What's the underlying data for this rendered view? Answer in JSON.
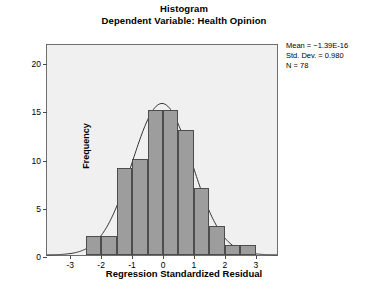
{
  "chart_data": {
    "type": "bar",
    "title": "Histogram",
    "subtitle": "Dependent Variable: Health Opinion",
    "xlabel": "Regression Standardized Residual",
    "ylabel": "Frequency",
    "xlim": [
      -3.75,
      3.75
    ],
    "ylim": [
      0,
      22
    ],
    "grid": false,
    "legend": "none",
    "bin_width": 0.5,
    "bin_centers": [
      -2.75,
      -2.25,
      -1.75,
      -1.25,
      -0.75,
      -0.25,
      0.25,
      0.75,
      1.25,
      1.75,
      2.25,
      2.75
    ],
    "bin_edges": [
      -3.0,
      -2.5,
      -2.0,
      -1.5,
      -1.0,
      -0.5,
      0.0,
      0.5,
      1.0,
      1.5,
      2.0,
      2.5,
      3.0
    ],
    "categories": [
      "-3.0 to -2.5",
      "-2.5 to -2.0",
      "-2.0 to -1.5",
      "-1.5 to -1.0",
      "-1.0 to -0.5",
      "-0.5 to 0.0",
      "0.0 to 0.5",
      "0.5 to 1.0",
      "1.0 to 1.5",
      "1.5 to 2.0",
      "2.0 to 2.5",
      "2.5 to 3.0"
    ],
    "values": [
      0,
      2,
      2,
      9,
      10,
      15,
      15,
      13,
      7,
      3,
      1,
      1
    ],
    "xticks": [
      -3,
      -2,
      -1,
      0,
      1,
      2,
      3
    ],
    "xtick_labels": [
      "-3",
      "-2",
      "-1",
      "0",
      "1",
      "2",
      "3"
    ],
    "yticks": [
      0,
      5,
      10,
      15,
      20
    ],
    "ytick_labels": [
      "0",
      "5",
      "10",
      "15",
      "20"
    ],
    "normal_curve": {
      "mean": 0,
      "std_dev": 0.98,
      "n": 78,
      "peak_frequency": 15.9
    },
    "bar_fill_color": "#9d9d9d",
    "bar_edge_color": "#4d4d4d",
    "curve_color": "#2f2f2f",
    "plot_background": "#f0f0f0",
    "frame_color": "#6e6e6e"
  },
  "stats": {
    "mean": "Mean = −1.39E-16",
    "std_dev": "Std. Dev. = 0.980",
    "n": "N = 78"
  }
}
